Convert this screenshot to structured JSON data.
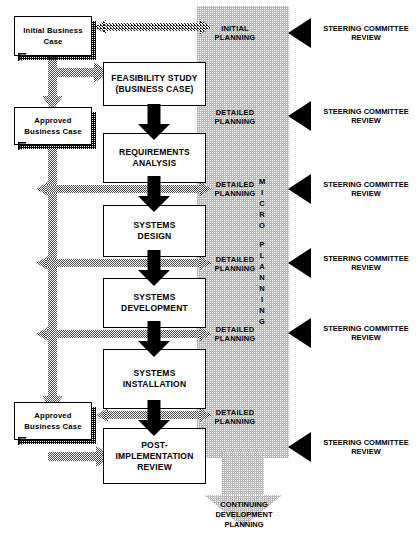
{
  "diagram": {
    "band": {
      "vertical_label": "MICRO PLANNING",
      "vertical_letters": [
        "M",
        "I",
        "C",
        "R",
        "O",
        "",
        "P",
        "L",
        "A",
        "N",
        "N",
        "I",
        "N",
        "G"
      ],
      "continuing_label": "CONTINUING\nDEVELOPMENT\nPLANNING",
      "continuing_lines": [
        "CONTINUING",
        "DEVELOPMENT",
        "PLANNING"
      ],
      "phase_labels": [
        {
          "line1": "INITIAL",
          "line2": "PLANNING"
        },
        {
          "line1": "DETAILED",
          "line2": "PLANNING"
        },
        {
          "line1": "DETAILED",
          "line2": "PLANNING"
        },
        {
          "line1": "DETAILED",
          "line2": "PLANNING"
        },
        {
          "line1": "DETAILED",
          "line2": "PLANNING"
        },
        {
          "line1": "DETAILED",
          "line2": "PLANNING"
        }
      ]
    },
    "documents": [
      {
        "line1": "Initial Business",
        "line2": "Case"
      },
      {
        "line1": "Approved",
        "line2": "Business Case"
      },
      {
        "line1": "Approved",
        "line2": "Business Case"
      }
    ],
    "processes": [
      {
        "line1": "FEASIBILITY STUDY",
        "line2": "(BUSINESS CASE)"
      },
      {
        "line1": "REQUIREMENTS",
        "line2": "ANALYSIS"
      },
      {
        "line1": "SYSTEMS",
        "line2": "DESIGN"
      },
      {
        "line1": "SYSTEMS",
        "line2": "DEVELOPMENT"
      },
      {
        "line1": "SYSTEMS",
        "line2": "INSTALLATION"
      },
      {
        "line1": "POST-IMPLEMENTATION",
        "line2": "REVIEW"
      }
    ],
    "reviews": [
      {
        "line1": "STEERING COMMITTEE",
        "line2": "REVIEW"
      },
      {
        "line1": "STEERING COMMITTEE",
        "line2": "REVIEW"
      },
      {
        "line1": "STEERING COMMITTEE",
        "line2": "REVIEW"
      },
      {
        "line1": "STEERING COMMITTEE",
        "line2": "REVIEW"
      },
      {
        "line1": "STEERING COMMITTEE",
        "line2": "REVIEW"
      },
      {
        "line1": "STEERING COMMITTEE",
        "line2": "REVIEW"
      }
    ],
    "colors": {
      "ink": "#000000",
      "band_fill": "#d8d8d8",
      "arrow_gray": "#6e6e6e",
      "paper": "#ffffff"
    }
  }
}
